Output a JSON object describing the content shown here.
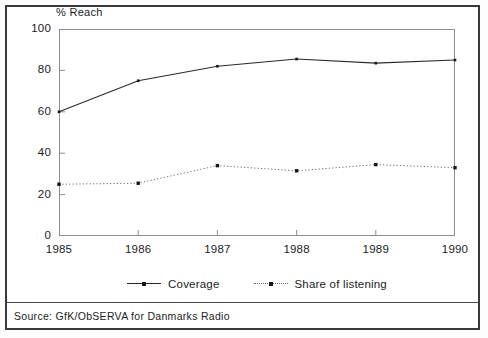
{
  "chart_data": {
    "type": "line",
    "title": "",
    "ylabel": "% Reach",
    "xlabel": "",
    "categories": [
      "1985",
      "1986",
      "1987",
      "1988",
      "1989",
      "1990"
    ],
    "ylim": [
      0,
      100
    ],
    "yticks": [
      0,
      20,
      40,
      60,
      80,
      100
    ],
    "grid": false,
    "legend_position": "bottom-center",
    "series": [
      {
        "name": "Coverage",
        "style": "solid",
        "marker": "dot",
        "values": [
          60,
          75,
          82,
          85.5,
          83.5,
          85
        ]
      },
      {
        "name": "Share of listening",
        "style": "dotted",
        "marker": "square",
        "values": [
          25,
          25.5,
          34,
          31.5,
          34.5,
          33
        ]
      }
    ],
    "source": "Source: GfK/ObSERVA for Danmarks Radio"
  },
  "axes": {
    "y_caption": "% Reach",
    "y_tick_labels": [
      "100",
      "80",
      "60",
      "40",
      "20",
      "0"
    ],
    "x_tick_labels": [
      "1985",
      "1986",
      "1987",
      "1988",
      "1989",
      "1990"
    ]
  },
  "legend": {
    "items": [
      {
        "label": "Coverage"
      },
      {
        "label": "Share of listening"
      }
    ]
  },
  "footer": {
    "source": "Source: GfK/ObSERVA for Danmarks Radio"
  },
  "colors": {
    "frame": "#3a3a3a",
    "plot_border": "#8e8e8e",
    "coverage_line": "#2a2a2a",
    "share_line": "#6a6a6a",
    "text": "#1c1c1c",
    "background": "#ffffff"
  }
}
